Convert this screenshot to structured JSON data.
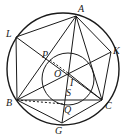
{
  "diagram": {
    "type": "geometry",
    "outer_circle": {
      "cx": 63,
      "cy": 69,
      "r": 56
    },
    "inner_circle": {
      "cx": 68,
      "cy": 79,
      "r": 26
    },
    "points": {
      "A": {
        "x": 76,
        "y": 16,
        "label": "A",
        "lx": 78,
        "ly": 12
      },
      "L": {
        "x": 16,
        "y": 37,
        "label": "L",
        "lx": 6,
        "ly": 37
      },
      "K": {
        "x": 111,
        "y": 52,
        "label": "K",
        "lx": 113,
        "ly": 54
      },
      "P": {
        "x": 50,
        "y": 60,
        "label": "P",
        "lx": 42,
        "ly": 58
      },
      "O": {
        "x": 68,
        "y": 73,
        "label": "O",
        "lx": 54,
        "ly": 77
      },
      "I": {
        "x": 70,
        "y": 80,
        "label": "I",
        "lx": 70,
        "ly": 86
      },
      "S": {
        "x": 68,
        "y": 95,
        "label": "S",
        "lx": 66,
        "ly": 96
      },
      "B": {
        "x": 17,
        "y": 100,
        "label": "B",
        "lx": 6,
        "ly": 106
      },
      "Q": {
        "x": 64,
        "y": 104,
        "label": "Q",
        "lx": 64,
        "ly": 113
      },
      "C": {
        "x": 102,
        "y": 100,
        "label": "C",
        "lx": 105,
        "ly": 109
      },
      "G": {
        "x": 62,
        "y": 123,
        "label": "G",
        "lx": 55,
        "ly": 134
      }
    },
    "segments": [
      [
        "A",
        "L"
      ],
      [
        "A",
        "K"
      ],
      [
        "A",
        "B"
      ],
      [
        "A",
        "C"
      ],
      [
        "A",
        "G"
      ],
      [
        "L",
        "B"
      ],
      [
        "L",
        "C"
      ],
      [
        "K",
        "C"
      ],
      [
        "K",
        "B"
      ],
      [
        "B",
        "C"
      ],
      [
        "B",
        "G"
      ],
      [
        "C",
        "G"
      ],
      [
        "C",
        "O"
      ]
    ],
    "dashed_segments": [
      [
        "B",
        "Q"
      ],
      [
        "P",
        "O"
      ]
    ]
  }
}
